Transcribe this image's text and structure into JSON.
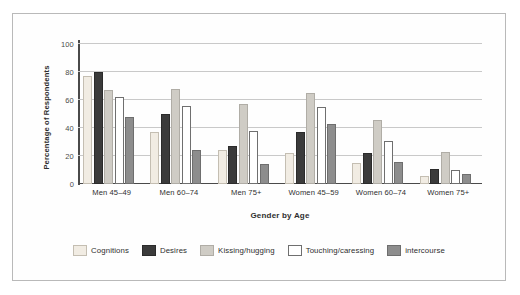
{
  "chart_data": {
    "type": "bar",
    "title": "",
    "xlabel": "Gender by Age",
    "ylabel": "Percentage of Respondents",
    "ylim": [
      0,
      100
    ],
    "yticks": [
      0,
      20,
      40,
      60,
      80,
      100
    ],
    "grid": true,
    "legend_position": "bottom",
    "categories": [
      "Men 45–49",
      "Men 60–74",
      "Men 75+",
      "Women 45–59",
      "Women 60–74",
      "Women 75+"
    ],
    "series": [
      {
        "name": "Cognitions",
        "color": "#f1ece3",
        "values": [
          77,
          37,
          24,
          22,
          15,
          6
        ]
      },
      {
        "name": "Desires",
        "color": "#3b3b3b",
        "values": [
          80,
          50,
          27,
          37,
          22,
          11
        ]
      },
      {
        "name": "Kissing/hugging",
        "color": "#cfccc5",
        "values": [
          67,
          68,
          57,
          65,
          46,
          23
        ]
      },
      {
        "name": "Touching/caressing",
        "color": "#ffffff",
        "values": [
          62,
          56,
          38,
          55,
          31,
          10
        ]
      },
      {
        "name": "intercourse",
        "color": "#8d8d8d",
        "values": [
          48,
          24,
          14,
          43,
          16,
          7
        ]
      }
    ]
  },
  "legend": {
    "items": [
      {
        "label": "Cognitions"
      },
      {
        "label": "Desires"
      },
      {
        "label": "Kissing/hugging"
      },
      {
        "label": "Touching/caressing"
      },
      {
        "label": "intercourse"
      }
    ]
  }
}
